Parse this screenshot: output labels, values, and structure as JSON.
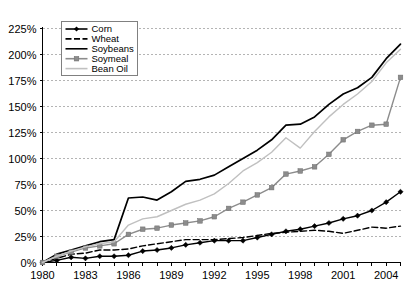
{
  "chart_data": {
    "type": "line",
    "title": "",
    "xlabel": "",
    "ylabel": "",
    "xlim": [
      1980,
      2005
    ],
    "ylim": [
      0,
      225
    ],
    "grid": true,
    "legend_position": "top-left",
    "y_ticks": [
      0,
      25,
      50,
      75,
      100,
      125,
      150,
      175,
      200,
      225
    ],
    "y_tick_labels": [
      "0%",
      "25%",
      "50%",
      "75%",
      "100%",
      "125%",
      "150%",
      "175%",
      "200%",
      "225%"
    ],
    "x_ticks": [
      1980,
      1981,
      1982,
      1983,
      1984,
      1985,
      1986,
      1987,
      1988,
      1989,
      1990,
      1991,
      1992,
      1993,
      1994,
      1995,
      1996,
      1997,
      1998,
      1999,
      2000,
      2001,
      2002,
      2003,
      2004,
      2005
    ],
    "x_tick_labels_shown": [
      "1980",
      "1983",
      "1986",
      "1989",
      "1992",
      "1995",
      "1998",
      "2001",
      "2004"
    ],
    "x": [
      1980,
      1981,
      1982,
      1983,
      1984,
      1985,
      1986,
      1987,
      1988,
      1989,
      1990,
      1991,
      1992,
      1993,
      1994,
      1995,
      1996,
      1997,
      1998,
      1999,
      2000,
      2001,
      2002,
      2003,
      2004,
      2005
    ],
    "series": [
      {
        "name": "Corn",
        "color": "#000000",
        "style": "solid",
        "marker": "diamond",
        "values": [
          0,
          2,
          5,
          4,
          6,
          6,
          7,
          11,
          12,
          14,
          17,
          19,
          21,
          21,
          21,
          24,
          27,
          30,
          32,
          35,
          38,
          42,
          45,
          50,
          58,
          68
        ]
      },
      {
        "name": "Wheat",
        "color": "#000000",
        "style": "dashed",
        "marker": "none",
        "values": [
          0,
          4,
          8,
          9,
          12,
          12,
          13,
          16,
          18,
          20,
          22,
          22,
          22,
          23,
          24,
          26,
          28,
          29,
          30,
          31,
          30,
          28,
          31,
          34,
          33,
          35
        ]
      },
      {
        "name": "Soybeans",
        "color": "#000000",
        "style": "solid",
        "marker": "none",
        "values": [
          0,
          8,
          12,
          16,
          20,
          22,
          62,
          63,
          60,
          68,
          78,
          80,
          84,
          92,
          100,
          108,
          118,
          132,
          133,
          140,
          152,
          162,
          168,
          178,
          196,
          210
        ]
      },
      {
        "name": "Soymeal",
        "color": "#8c8c8c",
        "style": "solid",
        "marker": "square",
        "values": [
          0,
          6,
          10,
          14,
          16,
          18,
          27,
          32,
          33,
          36,
          38,
          40,
          44,
          52,
          58,
          65,
          72,
          85,
          88,
          92,
          104,
          118,
          126,
          132,
          133,
          178
        ]
      },
      {
        "name": "Bean Oil",
        "color": "#c0c0c0",
        "style": "solid",
        "marker": "none",
        "values": [
          0,
          6,
          11,
          15,
          18,
          20,
          36,
          42,
          44,
          50,
          56,
          60,
          66,
          76,
          88,
          96,
          106,
          120,
          110,
          126,
          140,
          152,
          162,
          174,
          192,
          205
        ]
      }
    ]
  },
  "legend": {
    "items": [
      {
        "label": "Corn"
      },
      {
        "label": "Wheat"
      },
      {
        "label": "Soybeans"
      },
      {
        "label": "Soymeal"
      },
      {
        "label": "Bean Oil"
      }
    ]
  }
}
